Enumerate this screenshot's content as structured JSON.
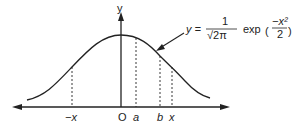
{
  "diagram": {
    "axis_y_label": "y",
    "origin_label": "O",
    "x_labels": [
      {
        "text": "−x",
        "x": 72
      },
      {
        "text": "a",
        "x": 136
      },
      {
        "text": "b",
        "x": 160
      },
      {
        "text": "x",
        "x": 172
      }
    ],
    "formula": {
      "lhs": "y =",
      "frac_num": "1",
      "frac_den": "√2π",
      "func": "exp",
      "exp_num": "−x²",
      "exp_den": "2"
    },
    "colors": {
      "line": "#222222",
      "background": "#ffffff"
    }
  }
}
